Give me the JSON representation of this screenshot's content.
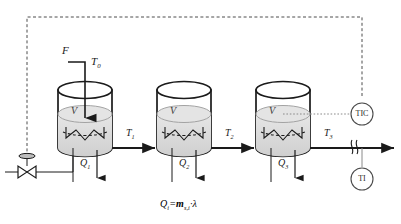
{
  "diagram": {
    "type": "process-flow-diagram",
    "equation": {
      "lhs": "Q",
      "lhs_sub": "i",
      "eq": "=",
      "rhs_var": "m",
      "rhs_sub": "s,i",
      "dot": "·",
      "lambda": "λ",
      "full_text": "Qi = ms,i · λ"
    },
    "feed": {
      "flow_label": "F",
      "inlet_temp_label": "T",
      "inlet_temp_sub": "0"
    },
    "tanks": [
      {
        "id": "tank-1",
        "volume_label": "V",
        "heat_label": "Q",
        "heat_sub": "1",
        "outlet_temp_label": "T",
        "outlet_temp_sub": "1"
      },
      {
        "id": "tank-2",
        "volume_label": "V",
        "heat_label": "Q",
        "heat_sub": "2",
        "outlet_temp_label": "T",
        "outlet_temp_sub": "2"
      },
      {
        "id": "tank-3",
        "volume_label": "V",
        "heat_label": "Q",
        "heat_sub": "3",
        "outlet_temp_label": "T",
        "outlet_temp_sub": "3"
      }
    ],
    "instruments": [
      {
        "id": "tic",
        "tag": "TIC",
        "name": "temperature-indicating-controller"
      },
      {
        "id": "ti",
        "tag": "TI",
        "name": "temperature-indicator"
      }
    ],
    "valve": {
      "name": "steam-control-valve",
      "type": "diaphragm-actuated-globe-valve"
    },
    "colors": {
      "line": "#1a1a1a",
      "signal": "#4d4d4d",
      "liquid": "#d9d9d9",
      "liquid_edge": "#8c8c8c",
      "vessel": "#1a1a1a",
      "text": "#1a1a1a"
    }
  }
}
